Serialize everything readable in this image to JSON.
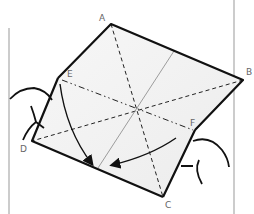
{
  "diagram": {
    "type": "origami-fold-instruction",
    "points": {
      "A": {
        "label": "A",
        "x": 111,
        "y": 24
      },
      "B": {
        "label": "B",
        "x": 243,
        "y": 80
      },
      "C": {
        "label": "C",
        "x": 163,
        "y": 197
      },
      "D": {
        "label": "D",
        "x": 32,
        "y": 141
      },
      "E": {
        "label": "E",
        "x": 58,
        "y": 78
      },
      "F": {
        "label": "F",
        "x": 195,
        "y": 130
      }
    },
    "lines": {
      "valley_folds": [
        "A-C",
        "B-D"
      ],
      "mountain_fold": "E-F",
      "thin_crease": "diagonal through center"
    },
    "arrows": [
      "E toward bottom edge",
      "F toward bottom edge"
    ],
    "colors": {
      "outline": "#111111",
      "paper": "#f4f4f4",
      "frame": "#999999",
      "label": "#666666"
    }
  }
}
